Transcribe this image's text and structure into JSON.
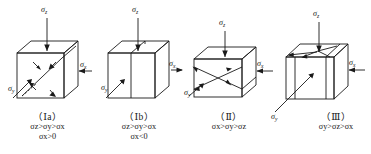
{
  "figure": {
    "type": "engineering-diagram",
    "stroke_color": "#1a1a1a",
    "background_color": "#ffffff"
  },
  "symbols": {
    "sigma_z": "σ",
    "sigma_x": "σ",
    "sigma_y": "σ",
    "sub_z": "z",
    "sub_x": "x",
    "sub_y": "y"
  },
  "panels": [
    {
      "id": "panel-1a",
      "label": "（Ⅰa）",
      "relation": "σz>σy>σx",
      "condition": "σx>0",
      "axis_labels": {
        "top": "σz",
        "right": "σx",
        "left": "σy"
      },
      "failure_mode": "inclined-shear-plane"
    },
    {
      "id": "panel-1b",
      "label": "（Ⅰb）",
      "relation": "σz>σy>σx",
      "condition": "σx<0",
      "axis_labels": {
        "top": "σz",
        "right": "σx",
        "left": "σy"
      },
      "failure_mode": "vertical-split-plane"
    },
    {
      "id": "panel-2",
      "label": "（Ⅱ）",
      "relation": "σx>σy>σz",
      "condition": "",
      "axis_labels": {
        "top": "σz",
        "right": "σx",
        "left": "σy"
      },
      "failure_mode": "crossed-shear-planes"
    },
    {
      "id": "panel-3",
      "label": "（Ⅲ）",
      "relation": "σy>σz>σx",
      "condition": "",
      "axis_labels": {
        "top": "σz",
        "right": "σx",
        "left": "σy"
      },
      "failure_mode": "vertical-split-with-top-convergence"
    }
  ]
}
